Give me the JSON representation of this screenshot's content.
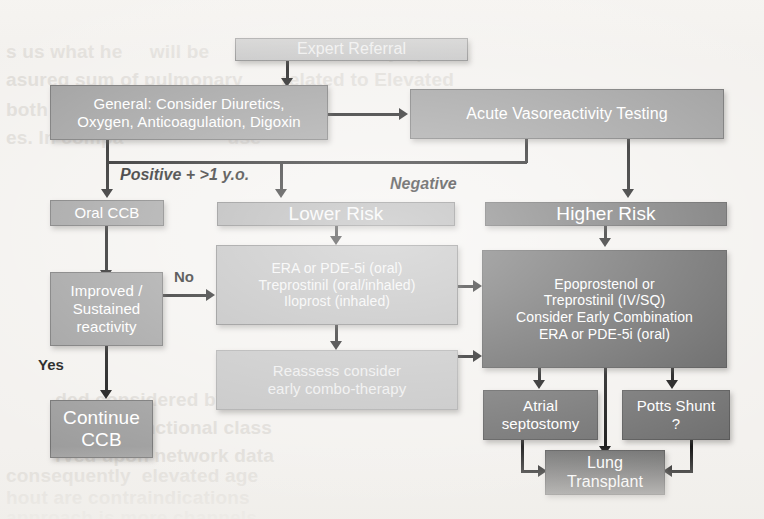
{
  "diagram": {
    "colors": {
      "node_light": "#b7b7b7",
      "node_mid": "#9b9b9b",
      "node_pale": "#c2c2c2",
      "node_dark": "#6d6d6d",
      "node_darker": "#5f5f5f",
      "arrow": "#101010",
      "page": "#f3f1ee"
    },
    "nodes": {
      "expert_referral": "Expert Referral",
      "general": "General: Consider Diuretics,\nOxygen, Anticoagulation, Digoxin",
      "general_line1": "General: Consider Diuretics,",
      "general_line2": "Oxygen, Anticoagulation, Digoxin",
      "acute_testing": "Acute Vasoreactivity Testing",
      "oral_ccb": "Oral CCB",
      "improved_line1": "Improved /",
      "improved_line2": "Sustained",
      "improved_line3": "reactivity",
      "continue_ccb_line1": "Continue",
      "continue_ccb_line2": "CCB",
      "lower_risk": "Lower Risk",
      "lower_meds_line1": "ERA or PDE-5i (oral)",
      "lower_meds_line2": "Treprostinil (oral/inhaled)",
      "lower_meds_line3": "Iloprost (inhaled)",
      "reassess_line1": "Reassess consider",
      "reassess_line2": "early combo-therapy",
      "higher_risk": "Higher Risk",
      "higher_meds_line1": "Epoprostenol  or",
      "higher_meds_line2": "Treprostinil (IV/SQ)",
      "higher_meds_line3": "Consider Early Combination",
      "higher_meds_line4": "ERA or PDE-5i (oral)",
      "atrial_line1": "Atrial",
      "atrial_line2": "septostomy",
      "potts_line1": "Potts Shunt",
      "potts_line2": "?",
      "lung_line1": "Lung",
      "lung_line2": "Transplant"
    },
    "edge_labels": {
      "positive": "Positive + >1 y.o.",
      "negative": "Negative",
      "no": "No",
      "yes": "Yes"
    }
  },
  "background_text": {
    "lines": [
      "s us what he     will be     with the World Sympo",
      "asureq sum of pulmonary       related to Elevated",
      "",
      "both as initial                     ulsation",
      "es. In compa                   use",
      "",
      "",
      "",
      "",
      "",
      "",
      "",
      "",
      "         ded considered by hemodynamic",
      "         n more functional class",
      "         rved upon network data",
      "consequently  elevated age",
      "hout are contraindications",
      "approach is more channels"
    ]
  }
}
